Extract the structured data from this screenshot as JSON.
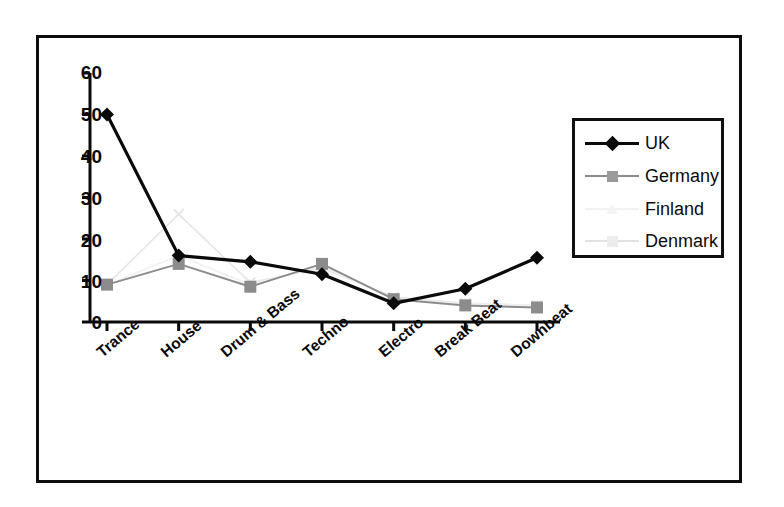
{
  "chart_data": {
    "type": "line",
    "title": "",
    "xlabel": "",
    "ylabel": "",
    "categories": [
      "Trance",
      "House",
      "Drum & Bass",
      "Techno",
      "Electro",
      "Break Beat",
      "Downbeat"
    ],
    "ylim": [
      0,
      60
    ],
    "yticks": [
      0,
      10,
      20,
      30,
      40,
      50,
      60
    ],
    "grid": false,
    "legend_position": "right",
    "series": [
      {
        "name": "UK",
        "color": "#0a0a0a",
        "marker": "diamond",
        "values": [
          50,
          16,
          14.5,
          11.5,
          4.5,
          8,
          15.5
        ]
      },
      {
        "name": "Germany",
        "color": "#8c8c8c",
        "marker": "square",
        "values": [
          9,
          14,
          8.5,
          14,
          5.5,
          4,
          3.5
        ]
      },
      {
        "name": "Finland",
        "color": "#f0f0f0",
        "marker": "triangle",
        "values": [
          9,
          16,
          9,
          13.5,
          5.5,
          4.5,
          4
        ]
      },
      {
        "name": "Denmark",
        "color": "#e6e6e6",
        "marker": "cross",
        "values": [
          9,
          26,
          9.5,
          13,
          6,
          4.5,
          4
        ]
      }
    ]
  },
  "axis": {
    "y_tick_labels": [
      "60",
      "50",
      "40",
      "30",
      "20",
      "10",
      "0"
    ]
  },
  "legend": {
    "items": [
      {
        "label": "UK"
      },
      {
        "label": "Germany"
      },
      {
        "label": "Finland"
      },
      {
        "label": "Denmark"
      }
    ]
  }
}
